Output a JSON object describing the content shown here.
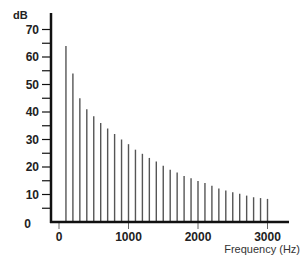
{
  "chart_data": {
    "type": "bar",
    "title": "",
    "xlabel": "Frequency (Hz)",
    "ylabel": "dB",
    "xlim": [
      0,
      3000
    ],
    "ylim": [
      0,
      70
    ],
    "grid": false,
    "legend": null,
    "x_ticks": [
      0,
      1000,
      2000,
      3000
    ],
    "y_ticks": [
      0,
      10,
      20,
      30,
      40,
      50,
      60,
      70
    ],
    "y_minor_step": 5,
    "x": [
      100,
      200,
      300,
      400,
      500,
      600,
      700,
      800,
      900,
      1000,
      1100,
      1200,
      1300,
      1400,
      1500,
      1600,
      1700,
      1800,
      1900,
      2000,
      2100,
      2200,
      2300,
      2400,
      2500,
      2600,
      2700,
      2800,
      2900,
      3000
    ],
    "values": [
      64,
      54,
      45,
      41,
      38.5,
      36,
      34,
      32,
      30,
      28.3,
      26.3,
      24.8,
      23.3,
      22,
      20.5,
      19,
      18,
      16.7,
      15.9,
      14.9,
      14.2,
      13.2,
      12.2,
      11.5,
      10.8,
      10.3,
      9.6,
      9,
      8.7,
      8.4
    ],
    "bar_color": "#555555",
    "axis_color": "#111111"
  }
}
